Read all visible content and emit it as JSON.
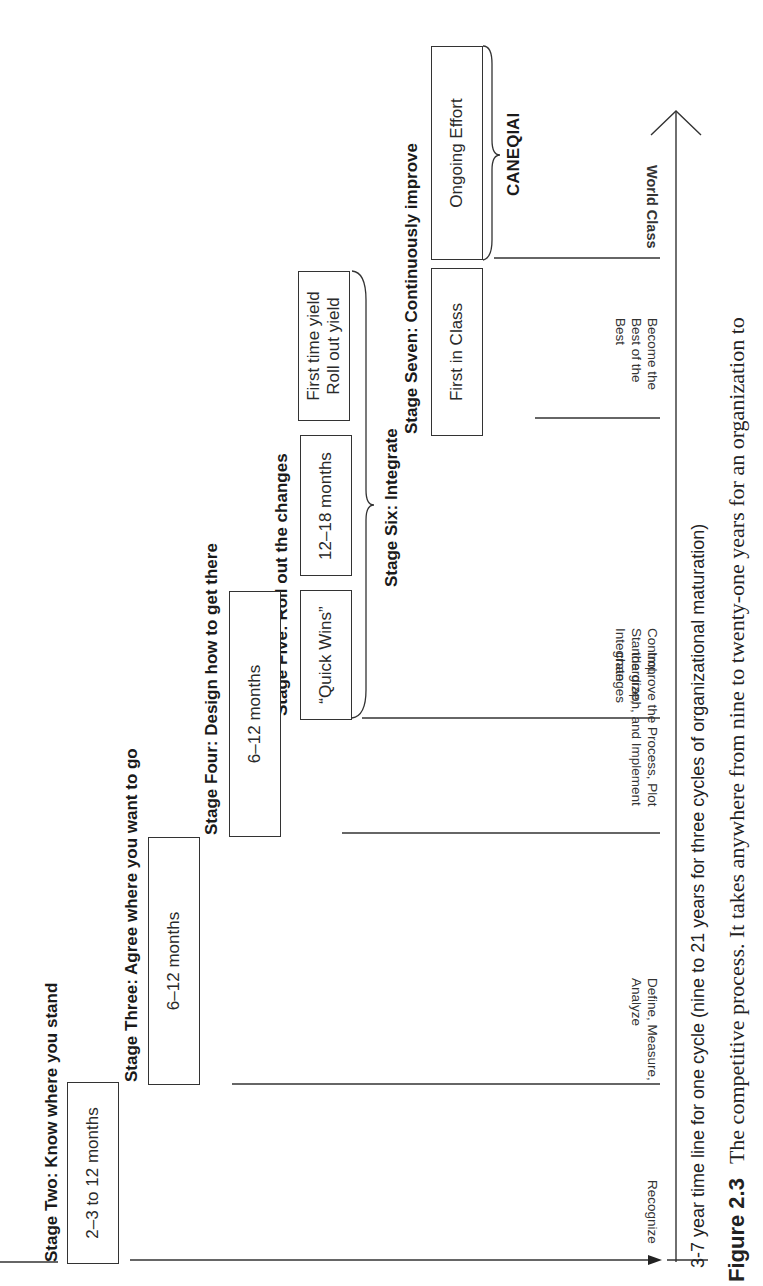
{
  "figure": {
    "number": "Figure 2.3",
    "caption_visible": "The competitive process. It takes anywhere from nine to twenty-one years for an organization to"
  },
  "timeline": {
    "axis_caption": "3-7 year time line for one cycle (nine to 21 years for three cycles of organizational maturation)"
  },
  "stages": [
    {
      "title": "Stage Two:  Know where you stand",
      "boxes": [
        "2–3 to 12  months"
      ]
    },
    {
      "title": "Stage Three:  Agree where you want to go",
      "boxes": [
        "6–12 months"
      ]
    },
    {
      "title": "Stage Four:  Design how to get there",
      "boxes": [
        "6–12 months"
      ]
    },
    {
      "title": "Stage Five:  Roll out the changes",
      "boxes": [
        "“Quick Wins”",
        "12–18 months",
        "First time yield",
        "Roll out yield"
      ]
    },
    {
      "title": "Stage Six: Integrate",
      "boxes": []
    },
    {
      "title": "Stage Seven:  Continuously improve",
      "boxes": [
        "First in Class",
        "Ongoing Effort"
      ]
    }
  ],
  "bracket_labels": {
    "canequai": "CANEQIAI"
  },
  "phases": [
    {
      "lines": [
        "Recognize"
      ]
    },
    {
      "lines": [
        "Define, Measure,",
        "Analyze"
      ]
    },
    {
      "lines": [
        "Improve the Process, Plot",
        "the graph, and Implement",
        "changes"
      ]
    },
    {
      "lines": [
        "Control,",
        "Standardize,",
        "Integrate"
      ]
    },
    {
      "lines": [
        "Become the",
        "Best of the",
        "Best"
      ]
    },
    {
      "lines": [
        "World Class"
      ]
    }
  ]
}
